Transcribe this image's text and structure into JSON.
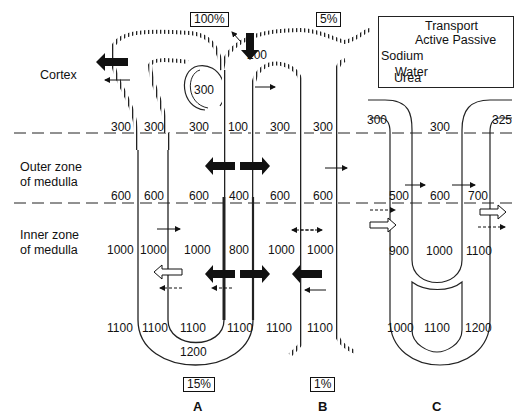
{
  "legend": {
    "header_line1": "Transport",
    "header_line2": "Active Passive",
    "rows": [
      {
        "label": "Sodium",
        "active": "solid-bold-arrow",
        "passive": "hollow-arrow"
      },
      {
        "label": "Water",
        "passive": "thin-solid-arrow"
      },
      {
        "label": "Urea",
        "passive": "dashed-arrow"
      }
    ]
  },
  "zones": {
    "cortex": "Cortex",
    "outer_line1": "Outer zone",
    "outer_line2": "of medulla",
    "inner_line1": "Inner zone",
    "inner_line2": "of medulla"
  },
  "panels": {
    "A": {
      "label": "A",
      "top_percent": "100%",
      "bottom_percent": "15%",
      "glomerulus_value": "300",
      "dcT_value": "200",
      "values_row_300": [
        "300",
        "300",
        "300",
        "100"
      ],
      "values_row_600": [
        "600",
        "600",
        "600",
        "400"
      ],
      "values_row_1000": [
        "1000",
        "1000",
        "1000",
        "800"
      ],
      "values_row_1100": [
        "1100",
        "1100",
        "1100",
        "1100"
      ],
      "loop_tip_value": "1200"
    },
    "B": {
      "label": "B",
      "top_percent": "5%",
      "bottom_percent": "1%",
      "values_row_300": [
        "300",
        "300"
      ],
      "values_row_600": [
        "600",
        "600"
      ],
      "values_row_1000": [
        "1000",
        "1000"
      ],
      "values_row_1100": [
        "1100",
        "1100"
      ]
    },
    "C": {
      "label": "C",
      "values_row_top": [
        "300",
        "300",
        "325"
      ],
      "values_row_mid": [
        "500",
        "600",
        "700"
      ],
      "values_row_inner": [
        "900",
        "1000",
        "1100"
      ],
      "values_row_bottom": [
        "1000",
        "1100",
        "1200"
      ]
    }
  },
  "colors": {
    "ink": "#111111",
    "background": "#ffffff"
  }
}
